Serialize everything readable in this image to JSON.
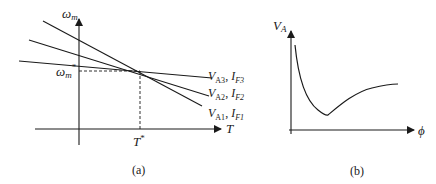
{
  "panel_a": {
    "caption": "(a)",
    "y_axis_label": "ω",
    "y_axis_sub": "m",
    "x_axis_label": "T",
    "op_speed_label": "ω",
    "op_speed_sub": "m",
    "op_speed_sup": "*",
    "op_torque_label": "T",
    "op_torque_sup": "*",
    "lines": [
      {
        "v": "V",
        "v_sub": "A3",
        "sep": ", ",
        "i": "I",
        "i_sub": "F3"
      },
      {
        "v": "V",
        "v_sub": "A2",
        "sep": ", ",
        "i": "I",
        "i_sub": "F2"
      },
      {
        "v": "V",
        "v_sub": "A1",
        "sep": ", ",
        "i": "I",
        "i_sub": "F1"
      }
    ]
  },
  "panel_b": {
    "caption": "(b)",
    "y_axis_label": "V",
    "y_axis_sub": "A",
    "x_axis_label": "ϕ"
  },
  "colors": {
    "ink": "#1a1a1a",
    "background": "#ffffff"
  }
}
